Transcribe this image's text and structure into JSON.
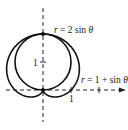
{
  "diagram": {
    "type": "polar-curves",
    "curves": [
      {
        "name": "circle",
        "equation_label": "r = 2 sin θ",
        "label_r": "r",
        "label_rest": " = 2 sin ",
        "label_theta": "θ"
      },
      {
        "name": "cardioid",
        "equation_label": "r = 1 + sin θ",
        "label_r": "r",
        "label_rest": " = 1 + sin ",
        "label_theta": "θ"
      }
    ],
    "axes": {
      "x_tick_label": "1",
      "y_tick_label": "1"
    },
    "colors": {
      "stroke": "#111111",
      "background": "#ffffff"
    }
  }
}
